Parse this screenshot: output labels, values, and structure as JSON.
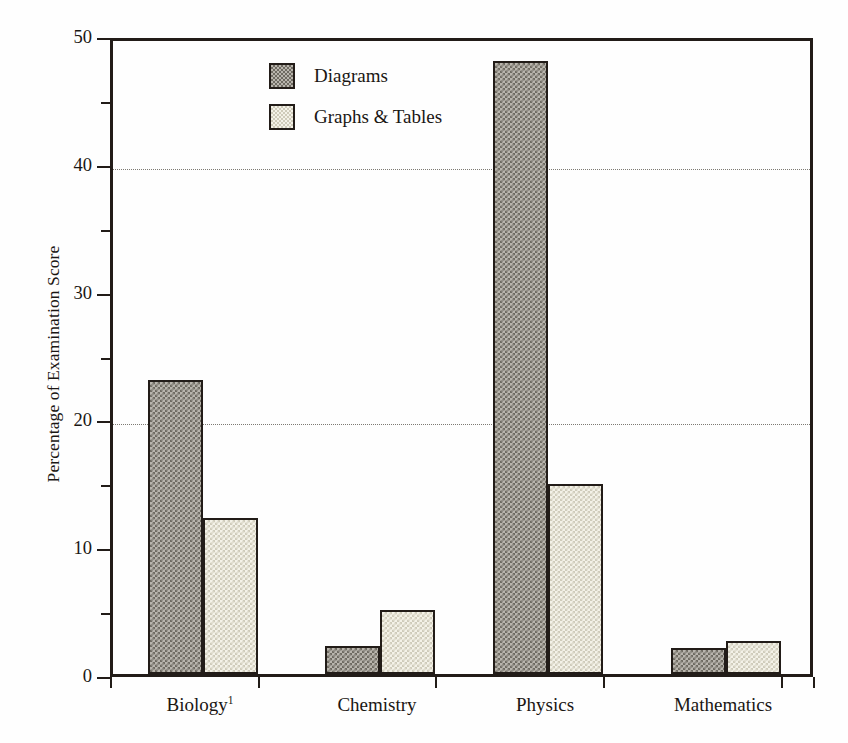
{
  "chart_data": {
    "type": "bar",
    "title": "",
    "xlabel": "",
    "ylabel": "Percentage of Examination Score",
    "ylim": [
      0,
      50
    ],
    "yticks": [
      0,
      10,
      20,
      30,
      40,
      50
    ],
    "ytick_labels": [
      "0",
      "10",
      "20",
      "30",
      "40",
      "50"
    ],
    "yminor_ticks": [
      5,
      15,
      25,
      35,
      45
    ],
    "gridlines": [
      20,
      40
    ],
    "grid": "horizontal-dotted-at-20-and-40",
    "legend_position": "upper-center-left",
    "categories": [
      "Biology¹",
      "Chemistry",
      "Physics",
      "Mathematics"
    ],
    "category_labels": [
      {
        "text": "Biology",
        "superscript": "1"
      },
      {
        "text": "Chemistry",
        "superscript": ""
      },
      {
        "text": "Physics",
        "superscript": ""
      },
      {
        "text": "Mathematics",
        "superscript": ""
      }
    ],
    "series": [
      {
        "name": "Diagrams",
        "values": [
          23,
          2.2,
          48,
          2.0
        ],
        "fill": "dark-checker",
        "color": "#8a867d"
      },
      {
        "name": "Graphs & Tables",
        "values": [
          12.2,
          5.0,
          14.9,
          2.6
        ],
        "fill": "light-stipple",
        "color": "#eceadf"
      }
    ]
  },
  "legend": {
    "entries": [
      {
        "label": "Diagrams",
        "swatch": "diagrams"
      },
      {
        "label": "Graphs & Tables",
        "swatch": "graphs"
      }
    ]
  },
  "axes": {
    "y_title": "Percentage of Examination Score",
    "frame_color": "#221c18",
    "gridline_color": "#7d7a73",
    "background": "#fefefe"
  }
}
